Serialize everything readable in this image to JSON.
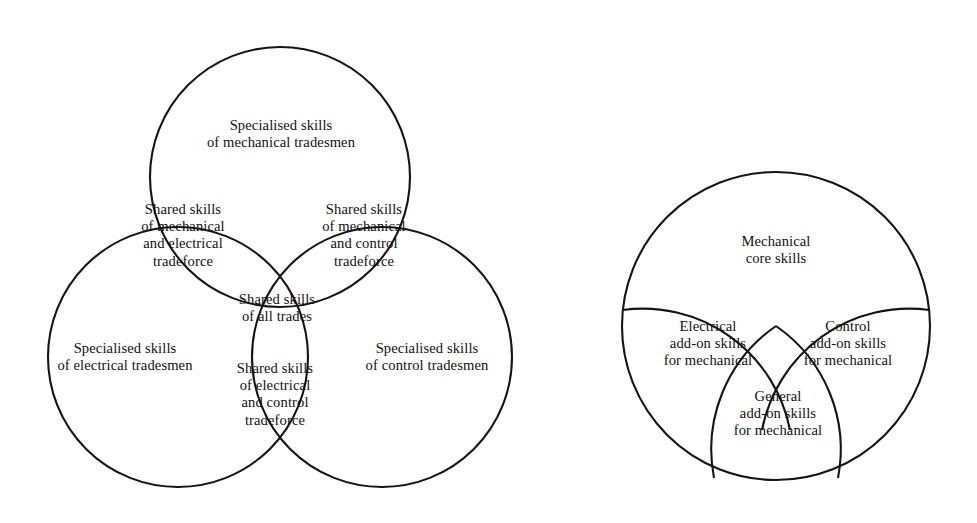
{
  "figure": {
    "background_color": "#ffffff",
    "stroke_color": "#141414",
    "text_color": "#111111"
  },
  "left_diagram": {
    "name": "three-circle-venn-trades",
    "circles": [
      {
        "id": "mechanical",
        "cx": 280,
        "cy": 177,
        "r": 130
      },
      {
        "id": "electrical",
        "cx": 178,
        "cy": 357,
        "r": 130
      },
      {
        "id": "control",
        "cx": 382,
        "cy": 357,
        "r": 130
      }
    ],
    "regions": [
      {
        "id": "mechanical-only",
        "label": "Specialised skills\nof mechanical tradesmen",
        "x": 281,
        "y": 134
      },
      {
        "id": "mechanical-electrical",
        "label": "Shared skills\nof mechanical\nand electrical\ntradeforce",
        "x": 183,
        "y": 235
      },
      {
        "id": "mechanical-control",
        "label": "Shared skills\nof mechanical\nand control\ntradeforce",
        "x": 364,
        "y": 235
      },
      {
        "id": "all-trades",
        "label": "Shared skills\nof all trades",
        "x": 277,
        "y": 308
      },
      {
        "id": "electrical-only",
        "label": "Specialised skills\nof electrical tradesmen",
        "x": 125,
        "y": 357
      },
      {
        "id": "control-only",
        "label": "Specialised skills\nof control tradesmen",
        "x": 427,
        "y": 357
      },
      {
        "id": "electrical-control",
        "label": "Shared skills\nof electrical\nand control\ntradeforce",
        "x": 275,
        "y": 394
      }
    ]
  },
  "right_diagram": {
    "name": "mechanical-core-skills-circle",
    "circle": {
      "id": "mechanical-core",
      "cx": 776,
      "cy": 326,
      "r": 154
    },
    "regions": [
      {
        "id": "mechanical-core",
        "label": "Mechanical\ncore skills",
        "x": 776,
        "y": 250
      },
      {
        "id": "electrical-add-on",
        "label": "Electrical\nadd-on skills\nfor mechanical",
        "x": 708,
        "y": 344
      },
      {
        "id": "control-add-on",
        "label": "Control\nadd-on skills\nfor mechanical",
        "x": 848,
        "y": 344
      },
      {
        "id": "general-add-on",
        "label": "General\nadd-on skills\nfor mechanical",
        "x": 778,
        "y": 414
      }
    ]
  }
}
